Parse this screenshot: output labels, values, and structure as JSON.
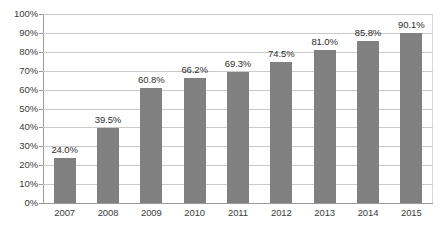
{
  "chart_data": {
    "type": "bar",
    "title": "",
    "subtitle": "",
    "xlabel": "",
    "ylabel": "",
    "categories": [
      "2007",
      "2008",
      "2009",
      "2010",
      "2011",
      "2012",
      "2013",
      "2014",
      "2015"
    ],
    "values": [
      24.0,
      39.5,
      60.8,
      66.2,
      69.3,
      74.5,
      81.0,
      85.8,
      90.1
    ],
    "data_labels": [
      "24.0%",
      "39.5%",
      "60.8%",
      "66.2%",
      "69.3%",
      "74.5%",
      "81.0%",
      "85.8%",
      "90.1%"
    ],
    "series": [
      {
        "name": "",
        "values": [
          24.0,
          39.5,
          60.8,
          66.2,
          69.3,
          74.5,
          81.0,
          85.8,
          90.1
        ]
      }
    ],
    "ylim": [
      0,
      100
    ],
    "ytick_values": [
      0,
      10,
      20,
      30,
      40,
      50,
      60,
      70,
      80,
      90,
      100
    ],
    "ytick_labels": [
      "0%",
      "10%",
      "20%",
      "30%",
      "40%",
      "50%",
      "60%",
      "70%",
      "80%",
      "90%",
      "100%"
    ],
    "grid": true,
    "grid_axis": "y",
    "legend": false,
    "legend_position": "none",
    "annotations": [],
    "colors": {
      "bar": "#808080",
      "gridline": "#c9c9c9",
      "axis": "#9a9a9a",
      "label_text": "#2e2e2e",
      "tick_text": "#3b3b3b",
      "background": "#ffffff"
    }
  }
}
